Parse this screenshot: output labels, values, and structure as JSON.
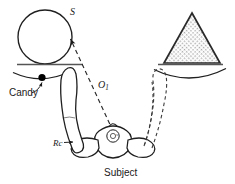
{
  "figure": {
    "kind": "experimental-apparatus-diagram",
    "caption_labels": {
      "sphere_label": "S",
      "gaze_label": "O",
      "gaze_label_subscript": "1",
      "reach_label": "Rc",
      "candy_label": "Candy",
      "subject_label": "Subject",
      "head_marker_label": "s"
    },
    "colors": {
      "ink": "#1a1a1a",
      "line": "#222222",
      "table_line": "#4a4a4a",
      "hatch_fill": "#9a9a9a",
      "background": "#ffffff",
      "candy_fill": "#000000"
    },
    "objects": [
      {
        "name": "sphere-stimulus",
        "label": "S",
        "shape": "circle",
        "cx": 45,
        "cy": 37,
        "r": 27,
        "fill": "none",
        "stroke_width": 1.3
      },
      {
        "name": "triangle-stimulus",
        "shape": "triangle",
        "apex": [
          192,
          14
        ],
        "base_left": [
          164,
          63
        ],
        "base_right": [
          220,
          63
        ],
        "fill": "hatched",
        "stroke_width": 1.6
      },
      {
        "name": "candy-target",
        "shape": "filled-circle",
        "cx": 42,
        "cy": 77,
        "r": 3.4,
        "fill": "#000000"
      }
    ],
    "table_surfaces": [
      {
        "name": "left-table-edge",
        "x1": 17,
        "y1": 64,
        "x2": 83,
        "y2": 64
      },
      {
        "name": "right-table-edge",
        "x1": 158,
        "y1": 64,
        "x2": 223,
        "y2": 64
      }
    ],
    "arcs": [
      {
        "name": "left-table-arc",
        "d": "M 14 73 Q 42 85 70 72"
      },
      {
        "name": "right-table-arc",
        "d": "M 155 70 Q 190 86 225 69"
      }
    ],
    "lines": [
      {
        "name": "gaze-line-o1",
        "style": "dashed",
        "from": [
          112,
          130
        ],
        "to": [
          69,
          38
        ],
        "arrow_at": "to"
      },
      {
        "name": "candy-pointer-arrow",
        "style": "curved-solid",
        "from": [
          33,
          92
        ],
        "to": [
          43,
          80
        ],
        "arrow_at": "to"
      },
      {
        "name": "rc-pointer-arrow",
        "style": "solid",
        "from": [
          64,
          142
        ],
        "to": [
          73,
          141
        ],
        "arrow_at": "to"
      }
    ],
    "limbs": [
      {
        "name": "left-arm-solid",
        "style": "solid",
        "reaching_toward": "candy-target"
      },
      {
        "name": "right-arm-dashed",
        "style": "dashed",
        "reaching_toward": "triangle-stimulus"
      }
    ]
  }
}
